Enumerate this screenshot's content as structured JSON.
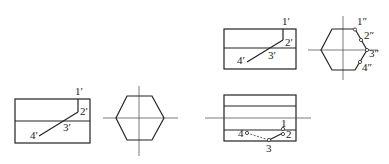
{
  "diagram": {
    "type": "orthographic-projection",
    "colors": {
      "line": "#222222",
      "background": "#ffffff"
    },
    "figures": [
      {
        "id": "left-pair",
        "views": [
          "front-view",
          "side-view-hexagon"
        ],
        "labels": {
          "p1": "1′",
          "p2": "2′",
          "p3": "3′",
          "p4": "4′"
        }
      },
      {
        "id": "right-top-pair",
        "views": [
          "front-view",
          "side-view-hexagon"
        ],
        "labels": {
          "p1": "1′",
          "p2": "2′",
          "p3": "3′",
          "p4": "4′",
          "s1": "1″",
          "s2": "2″",
          "s3": "3″",
          "s4": "4″"
        }
      },
      {
        "id": "right-bottom-top-view",
        "views": [
          "top-view"
        ],
        "labels": {
          "t1": "1",
          "t2": "2",
          "t3": "3",
          "t4": "4"
        }
      }
    ]
  }
}
